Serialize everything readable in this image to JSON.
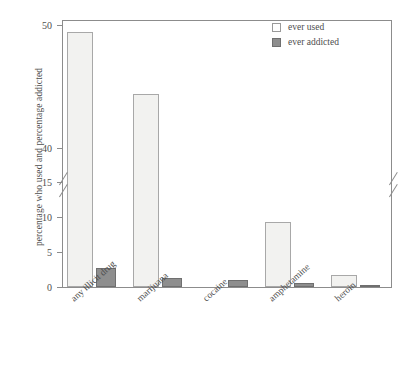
{
  "chart_data": {
    "type": "bar",
    "title": "",
    "xlabel": "",
    "ylabel": "percentage who used and percentage addicted",
    "categories": [
      "any illicit drug",
      "marijuana",
      "cocaine",
      "amphetamine",
      "heroin"
    ],
    "series": [
      {
        "name": "ever used",
        "values": [
          49.4,
          44.4,
          16.1,
          9.3,
          1.7
        ]
      },
      {
        "name": "ever addicted",
        "values": [
          2.7,
          1.3,
          1.0,
          0.6,
          0.3
        ]
      }
    ],
    "ytick_labels": [
      "0",
      "5",
      "10",
      "15",
      "40",
      "50"
    ],
    "ytick_values": [
      0,
      5,
      10,
      15,
      40,
      50
    ],
    "ylim": [
      0,
      50
    ],
    "axis_break": {
      "present": true,
      "lower_max": 15,
      "upper_min": 40
    },
    "grid": false,
    "legend_position": "top-right",
    "colors": {
      "ever_used_fill": "#f2f2f0",
      "ever_used_edge": "#a8a8a8",
      "ever_addicted_fill": "#8e8e8e",
      "ever_addicted_edge": "#6f6f6f",
      "axis": "#8c8c8c",
      "text": "#4e4e4e",
      "background": "#ffffff"
    }
  },
  "legend": {
    "items": [
      {
        "label": "ever used"
      },
      {
        "label": "ever addicted"
      }
    ]
  }
}
